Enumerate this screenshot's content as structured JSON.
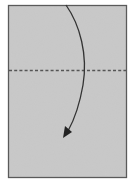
{
  "diagram": {
    "type": "origami-fold-instruction",
    "paper": {
      "x": 8,
      "y": 5,
      "width": 119,
      "height": 173,
      "fill": "#c8c8c8",
      "stroke": "#555555"
    },
    "fold_line": {
      "y": 70,
      "style": "dashed",
      "color": "#555555",
      "kind": "valley-fold"
    },
    "arrow": {
      "direction": "down",
      "color": "#333333",
      "path": "M66,5 C80,25 88,55 83,85 C79,108 72,124 66,136"
    },
    "colors": {
      "background": "#ffffff",
      "paper": "#c8c8c8",
      "outline": "#555555",
      "arrow": "#333333"
    }
  }
}
